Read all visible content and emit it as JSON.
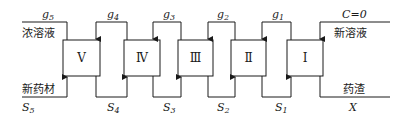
{
  "diagram": {
    "title": "",
    "stages": [
      {
        "id": "V",
        "label": "Ⅴ",
        "x": 63,
        "w": 37
      },
      {
        "id": "IV",
        "label": "Ⅳ",
        "x": 124,
        "w": 36
      },
      {
        "id": "III",
        "label": "Ⅲ",
        "x": 178,
        "w": 35
      },
      {
        "id": "II",
        "label": "Ⅱ",
        "x": 231,
        "w": 35
      },
      {
        "id": "I",
        "label": "Ⅰ",
        "x": 287,
        "w": 36
      }
    ],
    "solvent_flows": [
      {
        "name": "g",
        "sub": "5"
      },
      {
        "name": "g",
        "sub": "4"
      },
      {
        "name": "g",
        "sub": "3"
      },
      {
        "name": "g",
        "sub": "2"
      },
      {
        "name": "g",
        "sub": "1"
      }
    ],
    "solid_flows": [
      {
        "name": "S",
        "sub": "5"
      },
      {
        "name": "S",
        "sub": "4"
      },
      {
        "name": "S",
        "sub": "3"
      },
      {
        "name": "S",
        "sub": "2"
      },
      {
        "name": "S",
        "sub": "1"
      }
    ],
    "left_top_label": "浓溶液",
    "left_bottom_label": "新药材",
    "right_top_label": "新溶液",
    "right_top_condition": "C=0",
    "right_bottom_label": "药渣",
    "right_bottom_symbol": "X"
  }
}
